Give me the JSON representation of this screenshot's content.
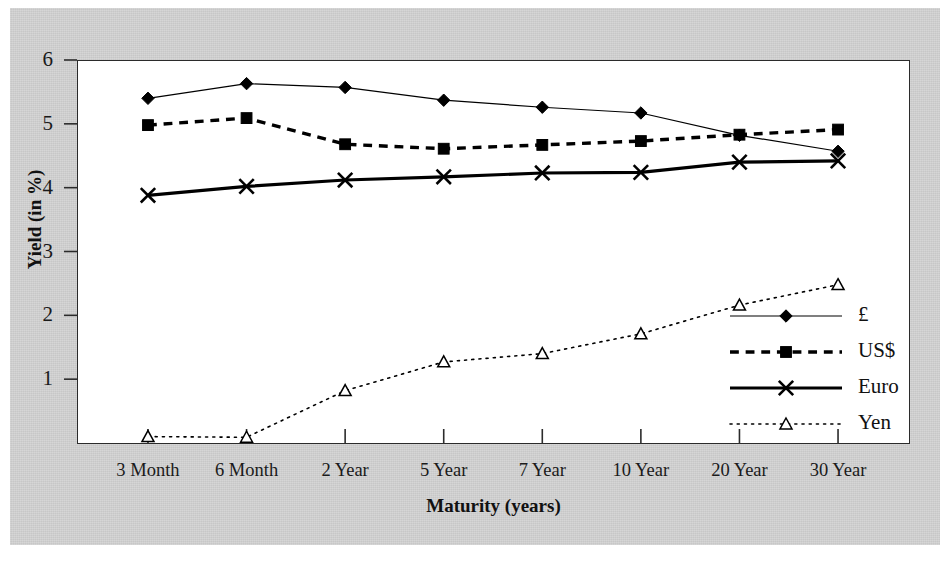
{
  "chart_data": {
    "type": "line",
    "title": "",
    "xlabel": "Maturity (years)",
    "ylabel": "Yield (in %)",
    "categories": [
      "3 Month",
      "6 Month",
      "2 Year",
      "5 Year",
      "7 Year",
      "10 Year",
      "20 Year",
      "30 Year"
    ],
    "ylim": [
      0,
      6
    ],
    "yticks": [
      1,
      2,
      3,
      4,
      5,
      6
    ],
    "ytick_labels": [
      "1",
      "2",
      "3",
      "4",
      "5",
      "6"
    ],
    "grid": false,
    "legend_position": "inside-right",
    "series": [
      {
        "name": "£",
        "marker": "diamond",
        "line_style": "solid",
        "line_width": 1.2,
        "color": "#000000",
        "values": [
          5.4,
          5.63,
          5.57,
          5.37,
          5.26,
          5.17,
          4.82,
          4.57
        ]
      },
      {
        "name": "US$",
        "marker": "square",
        "line_style": "dashed",
        "line_width": 3.4,
        "color": "#000000",
        "values": [
          4.98,
          5.09,
          4.68,
          4.61,
          4.67,
          4.73,
          4.83,
          4.91
        ]
      },
      {
        "name": "Euro",
        "marker": "cross",
        "line_style": "solid",
        "line_width": 3.2,
        "color": "#000000",
        "values": [
          3.88,
          4.02,
          4.12,
          4.17,
          4.23,
          4.24,
          4.4,
          4.42
        ]
      },
      {
        "name": "Yen",
        "marker": "triangle-open",
        "line_style": "dotted",
        "line_width": 1.6,
        "color": "#000000",
        "values": [
          0.1,
          0.09,
          0.82,
          1.27,
          1.4,
          1.71,
          2.16,
          2.48
        ]
      }
    ]
  },
  "legend": {
    "entries": [
      {
        "label": "£"
      },
      {
        "label": "US$"
      },
      {
        "label": "Euro"
      },
      {
        "label": "Yen"
      }
    ]
  },
  "colors": {
    "mat_background": "#cfcfcf",
    "plot_background": "#ffffff",
    "axis": "#2b2b2b",
    "ink": "#000000"
  }
}
